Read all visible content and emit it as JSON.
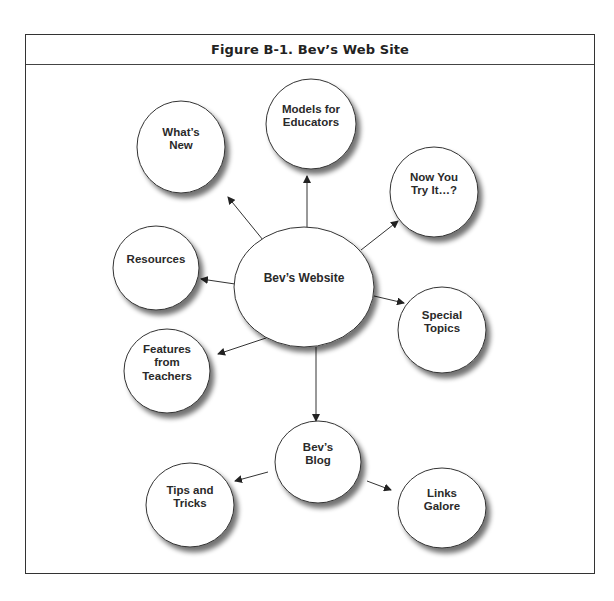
{
  "figure": {
    "title": "Figure B-1.  Bev’s Web Site"
  },
  "colors": {
    "stroke": "#333333",
    "fill": "#ffffff",
    "shadow": "#8a8a8a",
    "text": "#2a2a2a"
  },
  "nodes": [
    {
      "id": "center",
      "label": "Bev’s Website",
      "cx": 304,
      "cy": 287,
      "rx": 70,
      "ry": 60
    },
    {
      "id": "whats-new",
      "label": "What’s\nNew",
      "cx": 181,
      "cy": 147,
      "rx": 44,
      "ry": 46
    },
    {
      "id": "models",
      "label": "Models for\nEducators",
      "cx": 311,
      "cy": 124,
      "rx": 45,
      "ry": 45
    },
    {
      "id": "now-you",
      "label": "Now You\nTry It…?",
      "cx": 434,
      "cy": 192,
      "rx": 44,
      "ry": 45
    },
    {
      "id": "resources",
      "label": "Resources",
      "cx": 156,
      "cy": 268,
      "rx": 43,
      "ry": 42
    },
    {
      "id": "special",
      "label": "Special\nTopics",
      "cx": 442,
      "cy": 330,
      "rx": 44,
      "ry": 43
    },
    {
      "id": "features",
      "label": "Features\nfrom\nTeachers",
      "cx": 167,
      "cy": 371,
      "rx": 43,
      "ry": 42
    },
    {
      "id": "blog",
      "label": "Bev’s\nBlog",
      "cx": 318,
      "cy": 462,
      "rx": 43,
      "ry": 41
    },
    {
      "id": "tips",
      "label": "Tips and\nTricks",
      "cx": 190,
      "cy": 505,
      "rx": 44,
      "ry": 42
    },
    {
      "id": "links",
      "label": "Links\nGalore",
      "cx": 442,
      "cy": 508,
      "rx": 44,
      "ry": 40
    }
  ],
  "edges": [
    {
      "from": "center",
      "to": "whats-new",
      "x1": 263,
      "y1": 240,
      "x2": 228,
      "y2": 197
    },
    {
      "from": "center",
      "to": "models",
      "x1": 307,
      "y1": 228,
      "x2": 307,
      "y2": 176
    },
    {
      "from": "center",
      "to": "now-you",
      "x1": 361,
      "y1": 250,
      "x2": 398,
      "y2": 221
    },
    {
      "from": "center",
      "to": "resources",
      "x1": 235,
      "y1": 284,
      "x2": 201,
      "y2": 279
    },
    {
      "from": "center",
      "to": "special",
      "x1": 374,
      "y1": 296,
      "x2": 404,
      "y2": 303
    },
    {
      "from": "center",
      "to": "features",
      "x1": 266,
      "y1": 338,
      "x2": 218,
      "y2": 354
    },
    {
      "from": "center",
      "to": "blog",
      "x1": 316,
      "y1": 347,
      "x2": 316,
      "y2": 421
    },
    {
      "from": "blog",
      "to": "tips",
      "x1": 268,
      "y1": 472,
      "x2": 235,
      "y2": 481
    },
    {
      "from": "blog",
      "to": "links",
      "x1": 367,
      "y1": 481,
      "x2": 391,
      "y2": 490
    }
  ]
}
